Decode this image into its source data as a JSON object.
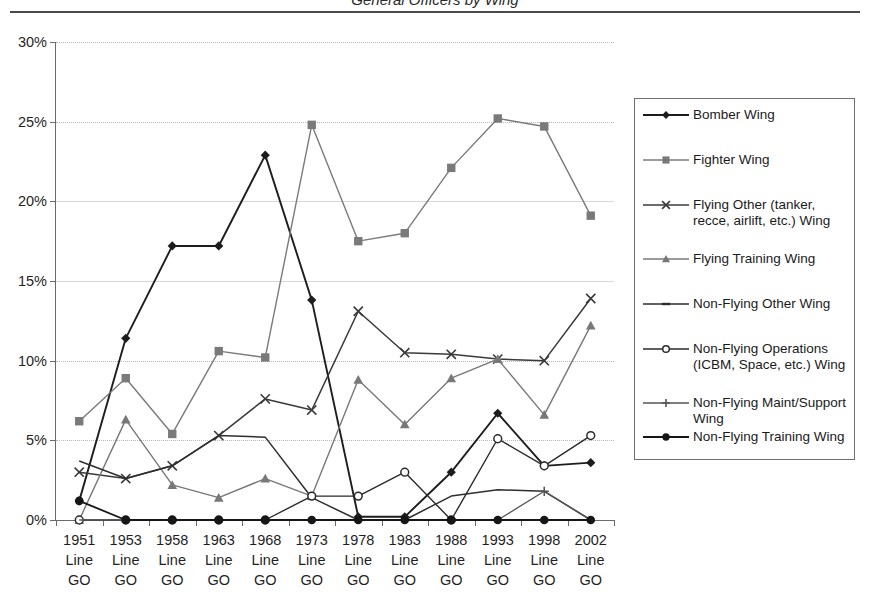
{
  "page": {
    "title_partial": "General Officers by Wing",
    "top_rule": true
  },
  "chart_data": {
    "type": "line",
    "title": "",
    "xlabel": "",
    "ylabel": "",
    "ylim": [
      0,
      30
    ],
    "yticks": [
      "0%",
      "5%",
      "10%",
      "15%",
      "20%",
      "25%",
      "30%"
    ],
    "ytick_values": [
      0,
      5,
      10,
      15,
      20,
      25,
      30
    ],
    "grid": true,
    "legend_position": "right",
    "categories": [
      "1951 Line GO",
      "1953 Line GO",
      "1958 Line GO",
      "1963 Line GO",
      "1968 Line GO",
      "1973 Line GO",
      "1978 Line GO",
      "1983 Line GO",
      "1988 Line GO",
      "1993 Line GO",
      "1998 Line GO",
      "2002 Line GO"
    ],
    "category_lines": [
      [
        "1951",
        "Line",
        "GO"
      ],
      [
        "1953",
        "Line",
        "GO"
      ],
      [
        "1958",
        "Line",
        "GO"
      ],
      [
        "1963",
        "Line",
        "GO"
      ],
      [
        "1968",
        "Line",
        "GO"
      ],
      [
        "1973",
        "Line",
        "GO"
      ],
      [
        "1978",
        "Line",
        "GO"
      ],
      [
        "1983",
        "Line",
        "GO"
      ],
      [
        "1988",
        "Line",
        "GO"
      ],
      [
        "1993",
        "Line",
        "GO"
      ],
      [
        "1998",
        "Line",
        "GO"
      ],
      [
        "2002",
        "Line",
        "GO"
      ]
    ],
    "series": [
      {
        "name": "Bomber Wing",
        "marker": "diamond",
        "color": "#1d1d1d",
        "width": 1.9,
        "values": [
          1.2,
          11.4,
          17.2,
          17.2,
          22.9,
          13.8,
          0.2,
          0.2,
          3.0,
          6.7,
          3.4,
          3.6
        ]
      },
      {
        "name": "Fighter Wing",
        "marker": "square",
        "color": "#7a7a7a",
        "width": 1.4,
        "values": [
          6.2,
          8.9,
          5.4,
          10.6,
          10.2,
          24.8,
          17.5,
          18.0,
          22.1,
          25.2,
          24.7,
          19.1
        ]
      },
      {
        "name": "Flying Other (tanker, recce, airlift, etc.) Wing",
        "marker": "x",
        "color": "#3a3a3a",
        "width": 1.5,
        "values": [
          3.0,
          2.6,
          3.4,
          5.3,
          7.6,
          6.9,
          13.1,
          10.5,
          10.4,
          10.1,
          10.0,
          13.9
        ]
      },
      {
        "name": "Flying Training Wing",
        "marker": "triangle",
        "color": "#787878",
        "width": 1.4,
        "values": [
          0.0,
          6.3,
          2.2,
          1.4,
          2.6,
          1.5,
          8.8,
          6.0,
          8.9,
          10.1,
          6.6,
          12.2
        ]
      },
      {
        "name": "Non-Flying Other Wing",
        "marker": "dash",
        "color": "#2e2e2e",
        "width": 1.5,
        "values": [
          3.7,
          2.6,
          3.4,
          5.3,
          5.2,
          1.4,
          0.0,
          0.0,
          1.5,
          1.9,
          1.8,
          0.0
        ]
      },
      {
        "name": "Non-Flying Operations (ICBM, Space, etc.) Wing",
        "marker": "open-circle",
        "color": "#2a2a2a",
        "width": 1.4,
        "values": [
          0.0,
          0.0,
          0.0,
          0.0,
          0.0,
          1.5,
          1.5,
          3.0,
          0.0,
          5.1,
          3.4,
          5.3
        ]
      },
      {
        "name": "Non-Flying Maint/Support Wing",
        "marker": "plus",
        "color": "#555555",
        "width": 1.3,
        "values": [
          0.0,
          0.0,
          0.0,
          0.0,
          0.0,
          0.0,
          0.0,
          0.0,
          0.0,
          0.0,
          1.8,
          0.0
        ]
      },
      {
        "name": "Non-Flying Training Wing",
        "marker": "filled-circle",
        "color": "#161616",
        "width": 1.8,
        "values": [
          1.2,
          0.0,
          0.0,
          0.0,
          0.0,
          0.0,
          0.0,
          0.0,
          0.0,
          0.0,
          0.0,
          0.0
        ]
      }
    ]
  }
}
